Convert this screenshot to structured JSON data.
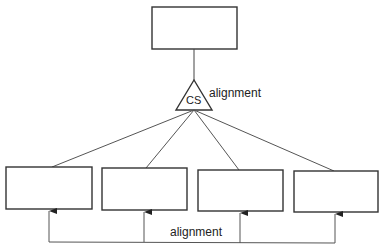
{
  "diagram": {
    "top_box": {
      "label": ""
    },
    "connector": {
      "label": "CS",
      "side_label": "alignment"
    },
    "child_boxes": [
      {
        "label": ""
      },
      {
        "label": ""
      },
      {
        "label": ""
      },
      {
        "label": ""
      }
    ],
    "bottom_label": "alignment",
    "colors": {
      "stroke": "#333333",
      "background": "#ffffff"
    }
  }
}
